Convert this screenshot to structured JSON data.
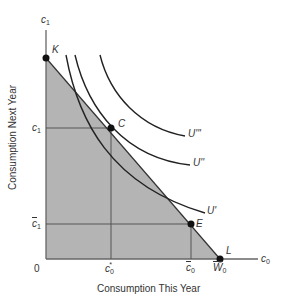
{
  "diagram": {
    "type": "intertemporal-consumption-choice",
    "axes": {
      "y_axis_symbol": "c",
      "y_axis_symbol_sub": "1",
      "x_axis_symbol": "c",
      "x_axis_symbol_sub": "0",
      "y_title": "Consumption Next Year",
      "x_title": "Consumption This Year",
      "origin": "0"
    },
    "ticks": {
      "y": [
        {
          "symbol": "c",
          "sub": "1",
          "bar": false,
          "label": "c1"
        },
        {
          "symbol": "c",
          "sub": "1",
          "bar": true,
          "label": "c̄1"
        }
      ],
      "x": [
        {
          "symbol": "c",
          "sub": "0",
          "sup": "*",
          "bar": false,
          "label": "c0*"
        },
        {
          "symbol": "c",
          "sub": "0",
          "bar": true,
          "label": "c̄0"
        },
        {
          "symbol": "W",
          "sub": "0",
          "bar": true,
          "label": "W̄0"
        }
      ]
    },
    "points": [
      {
        "label": "K",
        "description": "budget line y-intercept"
      },
      {
        "label": "C",
        "description": "optimal consumption tangency"
      },
      {
        "label": "E",
        "description": "endowment point"
      },
      {
        "label": "L",
        "description": "budget line x-intercept"
      }
    ],
    "curves": [
      {
        "label": "U'",
        "description": "lowest indifference curve"
      },
      {
        "label": "U''",
        "description": "middle indifference curve tangent at C"
      },
      {
        "label": "U'''",
        "description": "highest indifference curve"
      }
    ],
    "colors": {
      "shaded_region": "#b4b4b4",
      "axis": "#555555",
      "curve": "#222222",
      "point": "#111111",
      "guide_line": "#555555"
    }
  }
}
